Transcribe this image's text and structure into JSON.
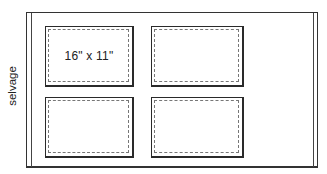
{
  "diagram": {
    "type": "fabric-cutting-layout",
    "fabric": {
      "edge_label": "selvage",
      "colors": {
        "line": "#333333",
        "stitch_line": "#777777",
        "background": "#ffffff"
      }
    },
    "panels": [
      {
        "position": "top-left",
        "label": "16\" x 11\""
      },
      {
        "position": "top-right",
        "label": ""
      },
      {
        "position": "bottom-left",
        "label": ""
      },
      {
        "position": "bottom-right",
        "label": ""
      }
    ]
  }
}
